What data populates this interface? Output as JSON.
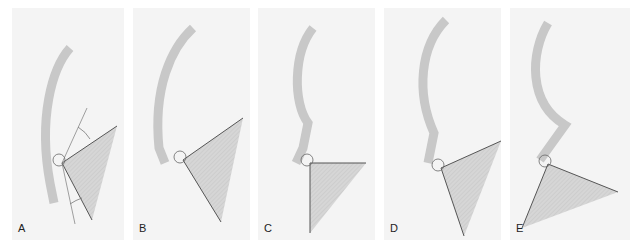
{
  "figure": {
    "colors": {
      "background": "#f4f4f4",
      "spine": "#c8c8c8",
      "wedge": "#d6d6d6",
      "line": "#555555"
    },
    "panels": [
      {
        "id": "A",
        "label": "A",
        "left": 12,
        "width": 112,
        "spine": "M58,40 C40,60 26,110 38,175 L42,195",
        "pivot": [
          50,
          155
        ],
        "wedge": "M50,155 L105,118 L80,212 Z",
        "extra_lines": [
          "M50,155 L75,100",
          "M50,155 L63,216"
        ],
        "arcs": [
          "M66,119 Q74,124 78,131",
          "M58,196 Q64,192 70,190"
        ]
      },
      {
        "id": "B",
        "label": "B",
        "left": 133,
        "width": 117,
        "spine": "M60,20 C38,40 20,80 26,140 L32,155",
        "pivot": [
          50,
          152
        ],
        "wedge": "M50,152 L110,110 L88,214 Z",
        "extra_lines": [],
        "arcs": []
      },
      {
        "id": "C",
        "label": "C",
        "left": 258,
        "width": 117,
        "spine": "M55,20 C35,45 35,95 50,115 L45,140 L38,155",
        "pivot": [
          52,
          155
        ],
        "wedge": "M52,155 L108,155 L52,225 Z",
        "extra_lines": [],
        "arcs": []
      },
      {
        "id": "D",
        "label": "D",
        "left": 384,
        "width": 117,
        "spine": "M62,12 C36,38 32,85 50,125 L44,155",
        "pivot": [
          57,
          160
        ],
        "wedge": "M57,160 L117,133 L80,228 Z",
        "extra_lines": [],
        "arcs": []
      },
      {
        "id": "E",
        "label": "E",
        "left": 510,
        "width": 120,
        "spine": "M38,15 C20,45 18,95 55,117 L40,138 L30,152",
        "pivot": [
          38,
          156
        ],
        "wedge": "M38,156 L108,184 L12,220 Z",
        "extra_lines": [],
        "arcs": []
      }
    ]
  }
}
